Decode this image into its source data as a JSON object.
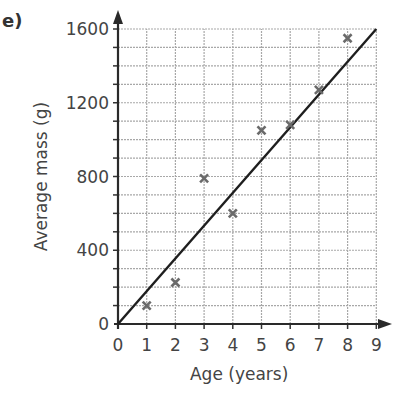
{
  "part_label": "e)",
  "chart_data": {
    "type": "scatter",
    "title": "",
    "xlabel": "Age (years)",
    "ylabel": "Average mass (g)",
    "xlim": [
      0,
      9
    ],
    "ylim": [
      0,
      1600
    ],
    "x_ticks": [
      0,
      1,
      2,
      3,
      4,
      5,
      6,
      7,
      8,
      9
    ],
    "y_ticks": [
      0,
      400,
      800,
      1200,
      1600
    ],
    "y_minor_step": 100,
    "grid": true,
    "marker": "x",
    "series": [
      {
        "name": "Data points",
        "x": [
          1,
          2,
          3,
          4,
          5,
          6,
          7,
          8
        ],
        "y": [
          100,
          225,
          790,
          600,
          1050,
          1080,
          1270,
          1550
        ]
      },
      {
        "name": "Line of best fit",
        "type": "line",
        "x": [
          0,
          9
        ],
        "y": [
          0,
          1600
        ]
      }
    ]
  }
}
